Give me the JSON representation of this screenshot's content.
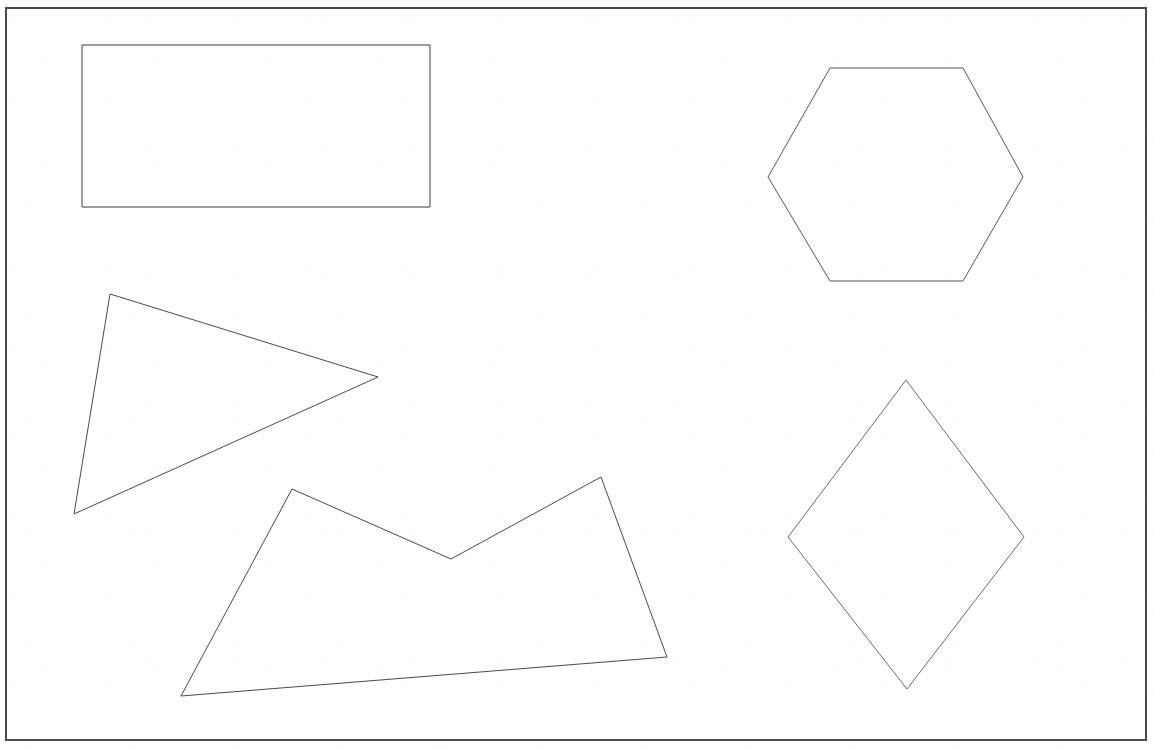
{
  "document": {
    "title": "Geometric Shapes Sheet",
    "kind": "scanned-line-drawing",
    "width": 1154,
    "height": 750,
    "background_color": "#fefefe",
    "stroke_color": "#3a3a3a",
    "stroke_width": 1,
    "fill": "none"
  },
  "border_frame": {
    "name": "page-border",
    "description": "Thin rectangular rule framing the whole sheet",
    "x": 6,
    "y": 8,
    "width": 1140,
    "height": 732,
    "stroke_color": "#4a4a4a",
    "stroke_width": 1.4
  },
  "shapes": [
    {
      "id": "rectangle",
      "label": "Rectangle",
      "sides": 4,
      "stroke_color": "#3f3f46",
      "points": [
        [
          82,
          45
        ],
        [
          430,
          45
        ],
        [
          430,
          207
        ],
        [
          82,
          207
        ]
      ]
    },
    {
      "id": "hexagon",
      "label": "Hexagon",
      "sides": 6,
      "stroke_color": "#58585e",
      "points": [
        [
          830,
          68
        ],
        [
          963,
          68
        ],
        [
          1023,
          177
        ],
        [
          963,
          281
        ],
        [
          830,
          281
        ],
        [
          768,
          177
        ]
      ]
    },
    {
      "id": "triangle",
      "label": "Triangle",
      "sides": 3,
      "stroke_color": "#4a4a50",
      "points": [
        [
          110,
          294
        ],
        [
          378,
          377
        ],
        [
          74,
          514
        ]
      ]
    },
    {
      "id": "zigzag-polygon",
      "label": "Zigzag Pentagon",
      "sides": 5,
      "stroke_color": "#4a4a50",
      "points": [
        [
          292,
          489
        ],
        [
          451,
          559
        ],
        [
          601,
          477
        ],
        [
          667,
          657
        ],
        [
          181,
          696
        ]
      ]
    },
    {
      "id": "diamond",
      "label": "Diamond",
      "sides": 4,
      "stroke_color": "#6a6a70",
      "points": [
        [
          906,
          380
        ],
        [
          1024,
          537
        ],
        [
          907,
          689
        ],
        [
          788,
          537
        ]
      ]
    }
  ],
  "chart_data": {
    "type": "scatter",
    "xlabel": "",
    "ylabel": "",
    "xlim": [
      0,
      1154
    ],
    "ylim": [
      750,
      0
    ],
    "grid": false,
    "legend": "none",
    "series": [
      {
        "name": "Rectangle",
        "x": [
          82,
          430,
          430,
          82,
          82
        ],
        "y": [
          45,
          45,
          207,
          207,
          45
        ]
      },
      {
        "name": "Hexagon",
        "x": [
          830,
          963,
          1023,
          963,
          830,
          768,
          830
        ],
        "y": [
          68,
          68,
          177,
          281,
          281,
          177,
          68
        ]
      },
      {
        "name": "Triangle",
        "x": [
          110,
          378,
          74,
          110
        ],
        "y": [
          294,
          377,
          514,
          294
        ]
      },
      {
        "name": "Zigzag Pentagon",
        "x": [
          292,
          451,
          601,
          667,
          181,
          292
        ],
        "y": [
          489,
          559,
          477,
          657,
          696,
          489
        ]
      },
      {
        "name": "Diamond",
        "x": [
          906,
          1024,
          907,
          788,
          906
        ],
        "y": [
          380,
          537,
          689,
          537,
          380
        ]
      }
    ]
  }
}
